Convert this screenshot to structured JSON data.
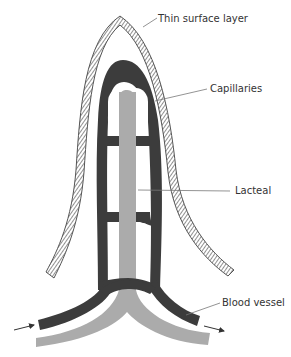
{
  "diagram": {
    "labels": {
      "surface_layer": "Thin surface layer",
      "capillaries": "Capillaries",
      "lacteal": "Lacteal",
      "blood_vessel": "Blood vessel"
    },
    "colors": {
      "background": "#ffffff",
      "capillary": "#3c3c3c",
      "lacteal": "#ababab",
      "surface_layer_stroke": "#555555",
      "label_text": "#333333",
      "leader_line": "#777777"
    },
    "flow_arrows": {
      "in": "arrow-right",
      "out": "arrow-right"
    }
  }
}
